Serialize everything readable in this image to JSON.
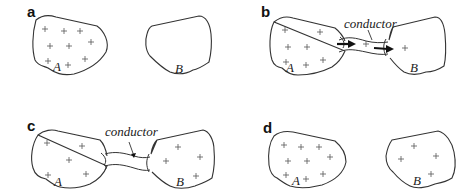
{
  "figure": {
    "panels": [
      {
        "id": "a",
        "label": "a",
        "body_a": {
          "label": "A",
          "charges": 9
        },
        "body_b": {
          "label": "B",
          "charges": 0
        },
        "connected": false
      },
      {
        "id": "b",
        "label": "b",
        "body_a": {
          "label": "A",
          "charges": 7
        },
        "body_b": {
          "label": "B",
          "charges": 1
        },
        "connected": true,
        "conductor_label": "conductor",
        "conductor_charges": 1,
        "arrows": "flow from A to B"
      },
      {
        "id": "c",
        "label": "c",
        "body_a": {
          "label": "A",
          "charges": 5
        },
        "body_b": {
          "label": "B",
          "charges": 4
        },
        "connected": true,
        "conductor_label": "conductor"
      },
      {
        "id": "d",
        "label": "d",
        "body_a": {
          "label": "A",
          "charges": 9
        },
        "body_b": {
          "label": "B",
          "charges": 4
        },
        "connected": false
      }
    ],
    "charge_symbol": "+"
  }
}
